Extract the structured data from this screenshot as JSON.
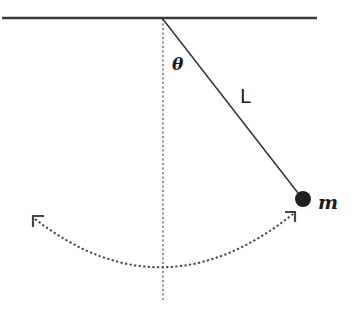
{
  "diagram": {
    "type": "simple-pendulum",
    "labels": {
      "angle": "θ",
      "length": "L",
      "mass": "m"
    },
    "colors": {
      "ink": "#333333",
      "bob": "#1f1f1f",
      "background": "#ffffff"
    },
    "geometry": {
      "ceiling": {
        "x1": 2,
        "y1": 18,
        "x2": 317,
        "y2": 18
      },
      "pivot": {
        "x": 162,
        "y": 18
      },
      "bob": {
        "cx": 303,
        "cy": 199,
        "r": 8
      },
      "vertical_reference_end_y": 302,
      "swing_arc": {
        "start": [
          33,
          217
        ],
        "bottom": [
          163,
          269
        ],
        "end": [
          294,
          213
        ]
      }
    }
  }
}
